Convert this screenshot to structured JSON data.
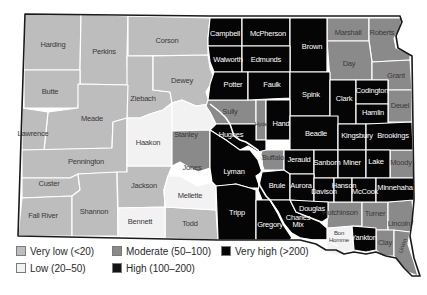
{
  "map": {
    "subject": "South Dakota counties choropleth",
    "colors": {
      "very_low": "#bdbdbd",
      "low": "#f2f2f2",
      "moderate": "#8a8a8a",
      "high": "#141414",
      "very_high": "#050505"
    },
    "counties": {
      "harding": "Harding",
      "perkins": "Perkins",
      "corson": "Corson",
      "campbell": "Campbell",
      "mcpherson": "McPherson",
      "brown": "Brown",
      "marshall": "Marshall",
      "roberts": "Roberts",
      "butte": "Butte",
      "ziebach": "Ziebach",
      "dewey": "Dewey",
      "walworth": "Walworth",
      "edmunds": "Edmunds",
      "day": "Day",
      "grant": "Grant",
      "meade": "Meade",
      "potter": "Potter",
      "faulk": "Faulk",
      "spink": "Spink",
      "clark": "Clark",
      "codington": "Codington",
      "deuel": "Deuel",
      "hamlin": "Hamlin",
      "lawrence": "Lawrence",
      "sully": "Sully",
      "hyde": "Hyde",
      "hand": "Hand",
      "beadle": "Beadle",
      "kingsbury": "Kingsbury",
      "brookings": "Brookings",
      "haakon": "Haakon",
      "stanley": "Stanley",
      "hughes": "Hughes",
      "pennington": "Pennington",
      "buffalo": "Buffalo",
      "jerauld": "Jerauld",
      "sanborn": "Sanborn",
      "miner": "Miner",
      "lake": "Lake",
      "moody": "Moody",
      "jones": "Jones",
      "lyman": "Lyman",
      "custer": "Custer",
      "jackson": "Jackson",
      "brule": "Brule",
      "aurora": "Aurora",
      "davison": "Davison",
      "hanson": "Hanson",
      "mccook": "McCook",
      "minnehaha": "Minnehaha",
      "mellette": "Mellette",
      "fall_river": "Fall River",
      "shannon": "Shannon",
      "tripp": "Tripp",
      "douglas": "Douglas",
      "hutchinson": "Hutchinson",
      "turner": "Turner",
      "lincoln": "Lincoln",
      "bennett": "Bennett",
      "todd": "Todd",
      "gregory": "Gregory",
      "charles_mix_1": "Charles",
      "charles_mix_2": "Mix",
      "bon_homme_1": "Bon",
      "bon_homme_2": "Homme",
      "yankton": "Yankton",
      "clay": "Clay",
      "union": "Union"
    }
  },
  "legend": {
    "items": [
      {
        "key": "very_low",
        "label": "Very low (<20)"
      },
      {
        "key": "low",
        "label": "Low (20–50)"
      },
      {
        "key": "moderate",
        "label": "Moderate (50–100)"
      },
      {
        "key": "high",
        "label": "High (100–200)"
      },
      {
        "key": "very_high",
        "label": "Very high (>200)"
      }
    ]
  }
}
